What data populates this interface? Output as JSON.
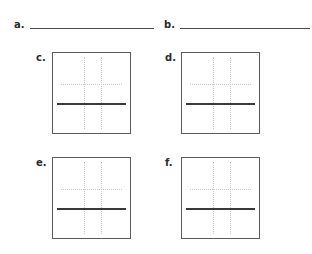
{
  "page": {
    "background_color": "#ffffff",
    "ink_color": "#2b2b2b",
    "rule_color": "#4a4a4a",
    "grid_color": "#c9c9c9",
    "plot_border_color": "#5a5a5a",
    "heavy_line_color": "#3a3a3a"
  },
  "answer_lines": [
    {
      "label": "a.",
      "value": "",
      "placeholder": ""
    },
    {
      "label": "b.",
      "value": "",
      "placeholder": ""
    }
  ],
  "plots": [
    {
      "label": "c.",
      "grid": {
        "vertical_guides": 2,
        "horizontal_guides": 1,
        "style": "dotted"
      },
      "drawn_line": {
        "orientation": "horizontal",
        "position": "below-center"
      }
    },
    {
      "label": "d.",
      "grid": {
        "vertical_guides": 2,
        "horizontal_guides": 1,
        "style": "dotted"
      },
      "drawn_line": {
        "orientation": "horizontal",
        "position": "below-center"
      }
    },
    {
      "label": "e.",
      "grid": {
        "vertical_guides": 2,
        "horizontal_guides": 1,
        "style": "dotted"
      },
      "drawn_line": {
        "orientation": "horizontal",
        "position": "below-center"
      }
    },
    {
      "label": "f.",
      "grid": {
        "vertical_guides": 2,
        "horizontal_guides": 1,
        "style": "dotted"
      },
      "drawn_line": {
        "orientation": "horizontal",
        "position": "below-center"
      }
    }
  ]
}
